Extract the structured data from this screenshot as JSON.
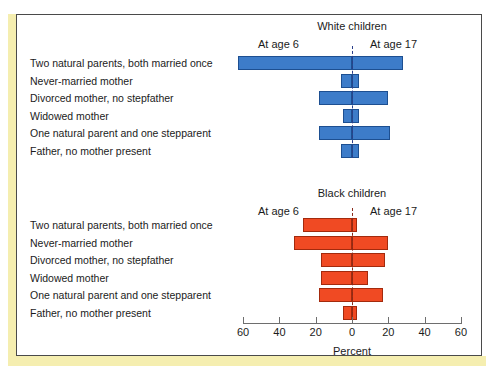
{
  "figure": {
    "axis_title": "Percent",
    "categories": [
      "Two natural parents, both married once",
      "Never-married mother",
      "Divorced mother, no stepfather",
      "Widowed mother",
      "One natural parent and one stepparent",
      "Father, no mother present"
    ],
    "left_series_label": "At age 6",
    "right_series_label": "At age 17",
    "tick_labels": [
      "60",
      "40",
      "20",
      "0",
      "20",
      "40",
      "60"
    ],
    "panels": [
      {
        "title": "White children",
        "color": "#3d7cc9"
      },
      {
        "title": "Black children",
        "color": "#f04a23"
      }
    ]
  },
  "chart_data": {
    "type": "bar",
    "title": "",
    "subtitle": "",
    "xlabel": "Percent",
    "ylabel": "",
    "xlim": [
      -60,
      60
    ],
    "grid": false,
    "legend_position": "above-axis",
    "orientation": "horizontal-diverging",
    "note": "Two stacked diverging (butterfly) bar panels. Left wing = 'At age 6', right wing = 'At age 17'. X axis shows Percent, mirrored 60-0-60.",
    "categories": [
      "Two natural parents, both married once",
      "Never-married mother",
      "Divorced mother, no stepfather",
      "Widowed mother",
      "One natural parent and one stepparent",
      "Father, no mother present"
    ],
    "panels": [
      {
        "name": "White children",
        "color": "#3d7cc9",
        "series": [
          {
            "name": "At age 6",
            "values": [
              63,
              6,
              18,
              5,
              18,
              6
            ]
          },
          {
            "name": "At age 17",
            "values": [
              28,
              4,
              20,
              4,
              21,
              4
            ]
          }
        ]
      },
      {
        "name": "Black children",
        "color": "#f04a23",
        "series": [
          {
            "name": "At age 6",
            "values": [
              27,
              32,
              17,
              17,
              18,
              5
            ]
          },
          {
            "name": "At age 17",
            "values": [
              3,
              20,
              18,
              9,
              17,
              3
            ]
          }
        ]
      }
    ]
  }
}
